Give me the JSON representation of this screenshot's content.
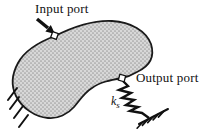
{
  "figure": {
    "labels": {
      "input_port": "Input port",
      "output_port": "Output port",
      "spring_symbol": "k",
      "spring_subscript": "s"
    },
    "colors": {
      "background": "#ffffff",
      "outline": "#1a1a1a",
      "body_fill": "#d8d8d8",
      "body_dot": "#a0a0a0",
      "text": "#111111",
      "port_marker_fill": "#ffffff"
    },
    "elements": {
      "body": "flexible-structure-blob",
      "input_arrow": "input-arrow-icon",
      "input_port_marker": "input-port-marker",
      "output_port_marker": "output-port-marker",
      "spring": "spring-zigzag-icon",
      "ground": "ground-anchor-icon",
      "left_support": "fixed-support-hatching-icon"
    }
  }
}
